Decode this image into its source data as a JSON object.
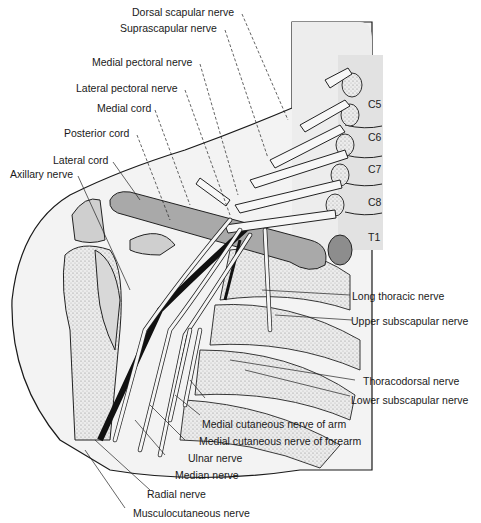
{
  "figure": {
    "colors": {
      "skin": "#f2f2f2",
      "bone": "#c8c8c8",
      "shade": "#9a9a9a",
      "nerve": "#e8e8e8",
      "artery": "#1a1a1a",
      "line": "#1a1a1a"
    }
  },
  "vertebrae": [
    "C5",
    "C6",
    "C7",
    "C8",
    "T1"
  ],
  "labels_left": [
    {
      "text": "Dorsal scapular nerve"
    },
    {
      "text": "Suprascapular nerve"
    },
    {
      "text": "Medial pectoral nerve"
    },
    {
      "text": "Lateral pectoral nerve"
    },
    {
      "text": "Medial cord"
    },
    {
      "text": "Posterior cord"
    },
    {
      "text": "Lateral cord"
    },
    {
      "text": "Axillary nerve"
    }
  ],
  "labels_right": [
    {
      "text": "Long thoracic nerve"
    },
    {
      "text": "Upper subscapular nerve"
    },
    {
      "text": "Thoracodorsal nerve"
    },
    {
      "text": "Lower subscapular nerve"
    }
  ],
  "labels_bottom": [
    {
      "text": "Medial cutaneous nerve of arm"
    },
    {
      "text": "Medial cutaneous nerve of forearm"
    },
    {
      "text": "Ulnar nerve"
    },
    {
      "text": "Median nerve"
    },
    {
      "text": "Radial nerve"
    },
    {
      "text": "Musculocutaneous nerve"
    }
  ]
}
